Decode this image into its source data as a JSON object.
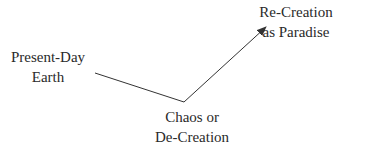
{
  "diagram": {
    "nodes": [
      {
        "id": "present",
        "lines": [
          "Present-Day",
          "Earth"
        ]
      },
      {
        "id": "chaos",
        "lines": [
          "Chaos or",
          "De-Creation"
        ]
      },
      {
        "id": "recreation",
        "lines": [
          "Re-Creation",
          "as Paradise"
        ]
      }
    ],
    "edges": [
      {
        "from": "present",
        "to": "chaos",
        "arrow": false
      },
      {
        "from": "chaos",
        "to": "recreation",
        "arrow": true
      }
    ],
    "line_color": "#333333"
  }
}
